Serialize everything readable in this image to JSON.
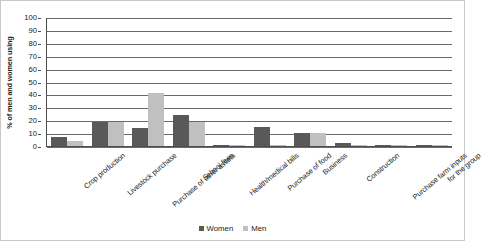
{
  "chart_data": {
    "type": "bar",
    "title": "",
    "xlabel": "",
    "ylabel": "% of men and women using",
    "ylim": [
      0,
      100
    ],
    "ytick_step": 10,
    "ytick_labels": [
      "100",
      "90",
      "80",
      "70",
      "60",
      "50",
      "40",
      "30",
      "20",
      "10",
      "0"
    ],
    "grid": true,
    "legend_position": "bottom-center",
    "categories": [
      "Crop production",
      "Livestock purchase",
      "Purchase of other assets",
      "School fees",
      "Health/medical bills",
      "Purchase of food",
      "Business",
      "Construction",
      "Purchase farm inputs",
      "for the group"
    ],
    "series": [
      {
        "name": "Women",
        "color": "#595959",
        "values": [
          7,
          19,
          14,
          24,
          1,
          15,
          10,
          2,
          1,
          1
        ]
      },
      {
        "name": "Men",
        "color": "#c0c0c0",
        "values": [
          4,
          19,
          41,
          19,
          0,
          0.5,
          10,
          0.5,
          0.5,
          0
        ]
      }
    ]
  },
  "legend": {
    "items": [
      {
        "label": "Women",
        "swatch": "women-swatch"
      },
      {
        "label": "Men",
        "swatch": "men-swatch"
      }
    ]
  }
}
